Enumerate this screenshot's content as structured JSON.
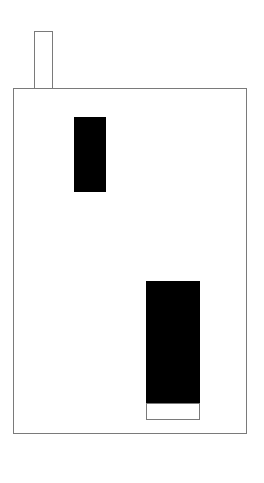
{
  "figure": {
    "background_color": "#ffffff",
    "outline_color": "#7a7a7a",
    "fill_color": "#000000",
    "width": 264,
    "height": 483
  },
  "shapes": {
    "container": {
      "name": "main container rectangle",
      "style": "outlined",
      "x": 13,
      "y": 88,
      "width": 234,
      "height": 346
    },
    "stub": {
      "name": "stub rectangle on top edge",
      "style": "outlined",
      "x": 34,
      "y": 31,
      "width": 19,
      "height": 58
    },
    "upper_bar": {
      "name": "upper filled bar",
      "style": "filled",
      "x": 74,
      "y": 117,
      "width": 32,
      "height": 75
    },
    "lower_bar": {
      "name": "lower filled bar",
      "style": "filled",
      "x": 146,
      "y": 281,
      "width": 54,
      "height": 122
    },
    "lower_bar_base": {
      "name": "white base box under lower bar",
      "style": "outlined",
      "x": 146,
      "y": 403,
      "width": 54,
      "height": 17
    }
  }
}
